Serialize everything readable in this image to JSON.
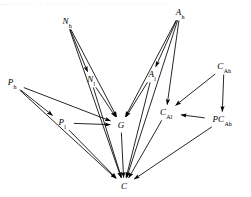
{
  "figure": {
    "width": 251,
    "height": 197,
    "background": "#ffffff",
    "stroke_color": "#000000",
    "top_cropped_text": "—  ·· ·· ·· · · ·· · ··· · ·· · · ·· ·· · ··· ·· · ·· · ··· ·"
  },
  "nodes": [
    {
      "id": "Ah",
      "base": "A",
      "sub": "h",
      "x": 180,
      "y": 13
    },
    {
      "id": "Nh",
      "base": "N",
      "sub": "h",
      "x": 67,
      "y": 22
    },
    {
      "id": "CAb",
      "base": "C",
      "sub": "Ah",
      "x": 224,
      "y": 67
    },
    {
      "id": "Al",
      "base": "A",
      "sub": "l",
      "x": 152,
      "y": 75
    },
    {
      "id": "Nl",
      "base": "N",
      "sub": "l",
      "x": 91,
      "y": 80
    },
    {
      "id": "Ph",
      "base": "P",
      "sub": "h",
      "x": 12,
      "y": 83
    },
    {
      "id": "CAl",
      "base": "C",
      "sub": "Al",
      "x": 166,
      "y": 113
    },
    {
      "id": "PCAb",
      "base": "PC",
      "sub": "Ah",
      "x": 222,
      "y": 120
    },
    {
      "id": "Pl",
      "base": "P",
      "sub": "l",
      "x": 62,
      "y": 123
    },
    {
      "id": "G",
      "base": "G",
      "sub": "",
      "x": 121,
      "y": 125
    },
    {
      "id": "C",
      "base": "C",
      "sub": "",
      "x": 124,
      "y": 186
    }
  ],
  "edges": [
    {
      "from": "Nh",
      "to": "Nl",
      "label": ""
    },
    {
      "from": "Nh",
      "to": "G",
      "label": ""
    },
    {
      "from": "Nh",
      "to": "C",
      "label": ""
    },
    {
      "from": "Nl",
      "to": "G",
      "label": ""
    },
    {
      "from": "Nl",
      "to": "C",
      "label": ""
    },
    {
      "from": "Ah",
      "to": "Al",
      "label": ""
    },
    {
      "from": "Ah",
      "to": "G",
      "label": ""
    },
    {
      "from": "Ah",
      "to": "CAl",
      "label": ""
    },
    {
      "from": "Ah",
      "to": "C",
      "label": ""
    },
    {
      "from": "Al",
      "to": "G",
      "label": ""
    },
    {
      "from": "Al",
      "to": "C",
      "label": ""
    },
    {
      "from": "Ph",
      "to": "Pl",
      "label": ""
    },
    {
      "from": "Ph",
      "to": "G",
      "label": ""
    },
    {
      "from": "Ph",
      "to": "C",
      "label": ""
    },
    {
      "from": "Pl",
      "to": "G",
      "label": ""
    },
    {
      "from": "Pl",
      "to": "C",
      "label": ""
    },
    {
      "from": "G",
      "to": "C",
      "label": ""
    },
    {
      "from": "CAb",
      "to": "CAl",
      "label": ""
    },
    {
      "from": "CAb",
      "to": "PCAb",
      "label": ""
    },
    {
      "from": "PCAb",
      "to": "CAl",
      "label": ""
    },
    {
      "from": "PCAb",
      "to": "C",
      "label": ""
    },
    {
      "from": "CAl",
      "to": "C",
      "label": ""
    }
  ]
}
